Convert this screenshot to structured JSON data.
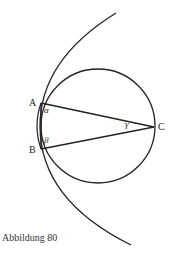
{
  "figure": {
    "caption": "Abbildung 80",
    "points": [
      {
        "name": "A",
        "x": 41,
        "y": 103
      },
      {
        "name": "B",
        "x": 41,
        "y": 149
      },
      {
        "name": "C",
        "x": 154,
        "y": 127
      }
    ],
    "angles": {
      "alpha": "α",
      "beta": "β",
      "gamma": "γ"
    },
    "labels": {
      "A": "A",
      "B": "B",
      "C": "C"
    },
    "circle": {
      "cx": 98,
      "cy": 126,
      "r": 57
    },
    "stroke_color": "#222222"
  }
}
